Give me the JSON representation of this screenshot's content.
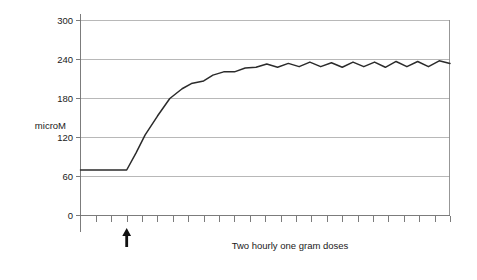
{
  "chart_data": {
    "type": "line",
    "title": "",
    "subtitle": "",
    "xlabel": "Two hourly one gram doses",
    "ylabel": "microM",
    "ylim": [
      0,
      300
    ],
    "xlim": [
      0,
      24
    ],
    "grid": true,
    "legend_position": "none",
    "y_ticks": [
      0,
      60,
      120,
      180,
      240,
      300
    ],
    "y_tick_labels": [
      "0",
      "60",
      "120",
      "180",
      "240",
      "300"
    ],
    "x_tick_count": 24,
    "x_tick_labels": [],
    "annotations": [
      {
        "name": "dose-start-arrow",
        "symbol": "up-arrow",
        "x": 3,
        "label": ""
      }
    ],
    "series": [
      {
        "name": "plasma concentration",
        "color": "#2b2b2b",
        "x": [
          0,
          1,
          2,
          3,
          3.6,
          4.2,
          5,
          5.8,
          6.6,
          7.2,
          8,
          8.6,
          9.3,
          10,
          10.7,
          11.4,
          12.1,
          12.8,
          13.5,
          14.2,
          14.9,
          15.6,
          16.3,
          17,
          17.7,
          18.4,
          19.1,
          19.8,
          20.5,
          21.2,
          21.9,
          22.6,
          23.3,
          24
        ],
        "values": [
          70,
          70,
          70,
          70,
          96,
          124,
          153,
          180,
          195,
          203,
          207,
          216,
          221,
          221,
          227,
          228,
          233,
          228,
          234,
          229,
          236,
          229,
          235,
          228,
          236,
          229,
          236,
          228,
          237,
          229,
          237,
          229,
          238,
          234
        ]
      }
    ]
  }
}
